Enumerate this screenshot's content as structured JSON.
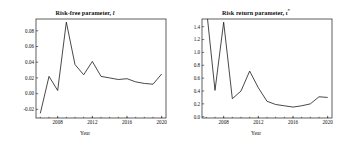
{
  "figure": {
    "background_color": "#ffffff",
    "line_color": "#1a1a1a",
    "axis_color": "#1a1a1a"
  },
  "panels": [
    {
      "id": "risk-free-parameter",
      "title_main": "Risk-free parameter,",
      "title_symbol": "l",
      "title_sup": "",
      "xlabel": "Year"
    },
    {
      "id": "risk-return-parameter",
      "title_main": "Risk return parameter,",
      "title_symbol": "ι",
      "title_sup": "*",
      "xlabel": "Year"
    }
  ],
  "chart_data": [
    {
      "type": "line",
      "title": "Risk-free parameter, l",
      "xlabel": "Year",
      "ylabel": "",
      "xlim": [
        2005.5,
        2020.5
      ],
      "ylim": [
        -0.031,
        0.095
      ],
      "xticks": [
        2008,
        2012,
        2016,
        2020
      ],
      "xticklabels": [
        "2008",
        "2012",
        "2016",
        "2020"
      ],
      "yticks": [
        -0.02,
        0.0,
        0.02,
        0.04,
        0.06,
        0.08
      ],
      "yticklabels": [
        "-0.02",
        "0.00",
        "0.02",
        "0.04",
        "0.06",
        "0.08"
      ],
      "grid": false,
      "legend": false,
      "series": [
        {
          "name": "risk-free parameter",
          "color": "#1a1a1a",
          "x": [
            2006,
            2007,
            2008,
            2009,
            2010,
            2011,
            2012,
            2013,
            2014,
            2015,
            2016,
            2017,
            2018,
            2019,
            2020
          ],
          "y": [
            -0.025,
            0.022,
            0.004,
            0.091,
            0.037,
            0.024,
            0.041,
            0.022,
            0.02,
            0.018,
            0.019,
            0.015,
            0.013,
            0.012,
            0.025
          ]
        }
      ]
    },
    {
      "type": "line",
      "title": "Risk return parameter, ι*",
      "xlabel": "Year",
      "ylabel": "",
      "xlim": [
        2005.5,
        2020.5
      ],
      "ylim": [
        -0.02,
        1.52
      ],
      "xticks": [
        2008,
        2012,
        2016,
        2020
      ],
      "xticklabels": [
        "2008",
        "2012",
        "2016",
        "2020"
      ],
      "yticks": [
        0.0,
        0.2,
        0.4,
        0.6,
        0.8,
        1.0,
        1.2,
        1.4
      ],
      "yticklabels": [
        "0.0",
        "0.2",
        "0.4",
        "0.6",
        "0.8",
        "1.0",
        "1.2",
        "1.4"
      ],
      "grid": false,
      "legend": false,
      "series": [
        {
          "name": "risk return parameter",
          "color": "#1a1a1a",
          "x": [
            2006,
            2007,
            2008,
            2009,
            2010,
            2011,
            2012,
            2013,
            2014,
            2015,
            2016,
            2017,
            2018,
            2019,
            2020
          ],
          "y": [
            1.7,
            0.41,
            1.47,
            0.28,
            0.4,
            0.71,
            0.45,
            0.24,
            0.19,
            0.17,
            0.15,
            0.17,
            0.2,
            0.31,
            0.3
          ]
        }
      ]
    }
  ]
}
